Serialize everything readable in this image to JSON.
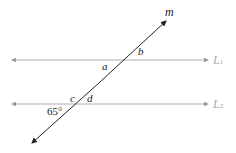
{
  "diagram": {
    "transversal_label": "m",
    "line1_label": "L",
    "line1_sub": "1",
    "line2_label": "L",
    "line2_sub": "2",
    "angles": {
      "a": "a",
      "b": "b",
      "c": "c",
      "d": "d"
    },
    "given_angle": "65°",
    "colors": {
      "parallel_lines": "#999999",
      "transversal": "#222222",
      "labels": "#222222",
      "line_labels": "#aaaaaa"
    }
  }
}
